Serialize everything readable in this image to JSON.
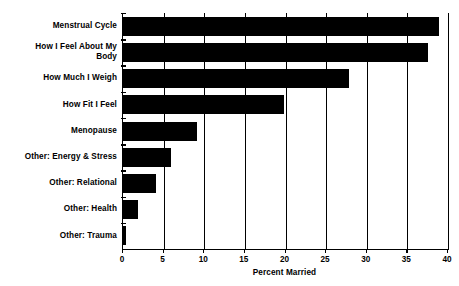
{
  "chart_data": {
    "type": "bar",
    "orientation": "horizontal",
    "title": "",
    "xlabel": "Percent Married",
    "ylabel": "",
    "xlim": [
      0,
      40
    ],
    "xticks": [
      0,
      5,
      10,
      15,
      20,
      25,
      30,
      35,
      40
    ],
    "xtick_labels": [
      "0",
      "5",
      "10",
      "15",
      "20",
      "25",
      "30",
      "35",
      "40"
    ],
    "grid": true,
    "legend": "none",
    "bar_color": "#000000",
    "background_color": "#FFFFFF",
    "categories": [
      "Menstrual Cycle",
      "How I Feel About My Body",
      "How Much I Weigh",
      "How Fit I Feel",
      "Menopause",
      "Other: Energy & Stress",
      "Other: Relational",
      "Other: Health",
      "Other: Trauma"
    ],
    "category_labels_display": [
      "Menstrual Cycle",
      "How I Feel About My\nBody",
      "How Much I Weigh",
      "How Fit I Feel",
      "Menopause",
      "Other: Energy & Stress",
      "Other: Relational",
      "Other: Health",
      "Other: Trauma"
    ],
    "values": [
      38.9,
      37.5,
      27.8,
      19.8,
      9.1,
      5.9,
      4.0,
      1.9,
      0.4
    ]
  }
}
